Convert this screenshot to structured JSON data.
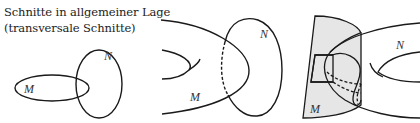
{
  "caption": {
    "line1": "Schnitte in allgemeiner Lage",
    "line2": "(transversale Schnitte)"
  },
  "figures": [
    {
      "id": "fig-1",
      "description": "two ellipses intersecting transversally",
      "labels": {
        "m": "M",
        "n": "N"
      }
    },
    {
      "id": "fig-2",
      "description": "curve M crossing ellipse N with dashed hidden arc",
      "labels": {
        "m": "M",
        "n": "N"
      }
    },
    {
      "id": "fig-3",
      "description": "shaded surface M intersecting surface N with dashed hidden curves",
      "labels": {
        "m": "M",
        "n": "N"
      }
    }
  ],
  "colors": {
    "stroke": "#1a1a1a",
    "surface_fill": "#e6e6e6",
    "text": "#222222"
  }
}
